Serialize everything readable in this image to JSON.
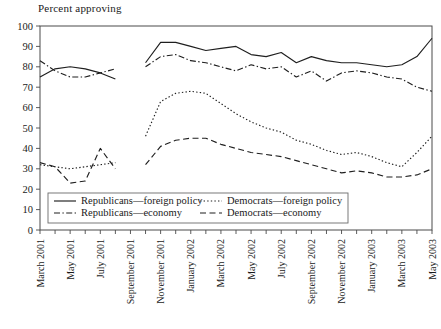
{
  "chart_data": {
    "type": "line",
    "title": "",
    "ylabel": "Percent approving",
    "xlabel": "",
    "ylim": [
      0,
      100
    ],
    "ytick_values": [
      0,
      10,
      20,
      30,
      40,
      50,
      60,
      70,
      80,
      90,
      100
    ],
    "grid": false,
    "legend_position": "bottom-left-inside",
    "x_axis_note": "Monthly observations, March 2001 through May 2003; labelled every other month",
    "x_tick_labels": [
      "March 2001",
      "May 2001",
      "July 2001",
      "September 2001",
      "November 2001",
      "January 2002",
      "March 2002",
      "May 2002",
      "July 2002",
      "September 2002",
      "November 2002",
      "January 2003",
      "March 2003",
      "May 2003"
    ],
    "x": [
      "March 2001",
      "April 2001",
      "May 2001",
      "June 2001",
      "July 2001",
      "August 2001",
      "September 2001",
      "October 2001",
      "November 2001",
      "December 2001",
      "January 2002",
      "February 2002",
      "March 2002",
      "April 2002",
      "May 2002",
      "June 2002",
      "July 2002",
      "August 2002",
      "September 2002",
      "October 2002",
      "November 2002",
      "December 2002",
      "January 2003",
      "February 2003",
      "March 2003",
      "April 2003",
      "May 2003"
    ],
    "series": [
      {
        "name": "Republicans—foreign policy",
        "style": "solid",
        "values": [
          75,
          79,
          80,
          79,
          77,
          74,
          null,
          82,
          92,
          92,
          90,
          88,
          89,
          90,
          86,
          85,
          87,
          82,
          85,
          83,
          82,
          82,
          81,
          80,
          81,
          85,
          94
        ]
      },
      {
        "name": "Republicans—economy",
        "style": "dashdot",
        "values": [
          83,
          78,
          75,
          75,
          77,
          79,
          null,
          80,
          85,
          86,
          83,
          82,
          80,
          78,
          81,
          79,
          80,
          75,
          78,
          73,
          77,
          78,
          77,
          75,
          74,
          70,
          68
        ]
      },
      {
        "name": "Democrats—foreign policy",
        "style": "dotted",
        "values": [
          32,
          31,
          30,
          31,
          32,
          33,
          null,
          46,
          63,
          67,
          68,
          67,
          62,
          57,
          53,
          50,
          48,
          44,
          42,
          39,
          37,
          38,
          36,
          33,
          31,
          38,
          46
        ]
      },
      {
        "name": "Democrats—economy",
        "style": "dashed",
        "values": [
          33,
          31,
          23,
          24,
          40,
          30,
          null,
          32,
          41,
          44,
          45,
          45,
          42,
          40,
          38,
          37,
          36,
          34,
          32,
          30,
          28,
          29,
          28,
          26,
          26,
          27,
          30
        ]
      }
    ],
    "series_pre_gap_labels": {
      "note": "Data interrupted between August 2001 and September 2001"
    }
  },
  "legend": {
    "entries": [
      {
        "label": "Republicans—foreign policy",
        "style": "solid"
      },
      {
        "label": "Democrats—foreign policy",
        "style": "dotted"
      },
      {
        "label": "Republicans—economy",
        "style": "dashdot"
      },
      {
        "label": "Democrats—economy",
        "style": "dashed"
      }
    ]
  },
  "colors": {
    "line": "#1f1f1f",
    "frame": "#4a4a4a",
    "text": "#1a1a1a",
    "background": "#ffffff"
  }
}
